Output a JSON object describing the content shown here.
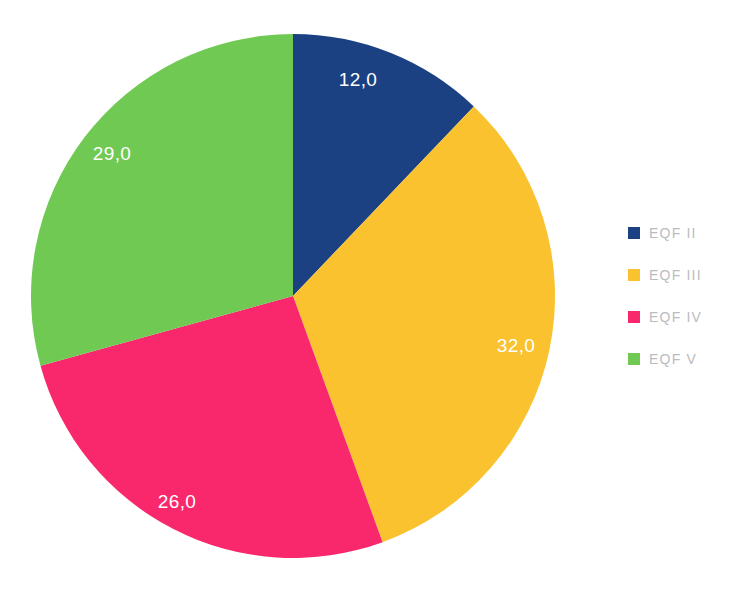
{
  "title_remnant": "",
  "chart_data": {
    "type": "pie",
    "title": "",
    "subtitle": "",
    "xlabel": "",
    "ylabel": "",
    "grid": false,
    "legend_position": "right",
    "start_angle_deg": 0,
    "direction": "clockwise",
    "total": 99,
    "categories": [
      "EQF II",
      "EQF III",
      "EQF IV",
      "EQF V"
    ],
    "values": [
      12,
      32,
      26,
      29
    ],
    "labels": [
      "12,0",
      "32,0",
      "26,0",
      "29,0"
    ],
    "colors": [
      "#1b4183",
      "#f9c22e",
      "#f9276b",
      "#6fc952"
    ],
    "slices": [
      {
        "name": "EQF II",
        "value": 12,
        "label": "12,0",
        "color": "#1b4183",
        "label_color": "#ffffff",
        "label_x": 358,
        "label_y": 86
      },
      {
        "name": "EQF III",
        "value": 32,
        "label": "32,0",
        "color": "#f9c22e",
        "label_color": "#ffffff",
        "label_x": 516,
        "label_y": 352
      },
      {
        "name": "EQF IV",
        "value": 26,
        "label": "26,0",
        "color": "#f9276b",
        "label_color": "#ffffff",
        "label_x": 177,
        "label_y": 508
      },
      {
        "name": "EQF V",
        "value": 29,
        "label": "29,0",
        "color": "#6fc952",
        "label_color": "#ffffff",
        "label_x": 112,
        "label_y": 160
      }
    ],
    "geometry": {
      "center_x": 293,
      "center_y": 296,
      "radius": 262
    }
  },
  "legend": {
    "items": [
      {
        "label": "EQF II",
        "color": "#1b4183"
      },
      {
        "label": "EQF III",
        "color": "#f9c22e"
      },
      {
        "label": "EQF IV",
        "color": "#f9276b"
      },
      {
        "label": "EQF V",
        "color": "#6fc952"
      }
    ]
  }
}
